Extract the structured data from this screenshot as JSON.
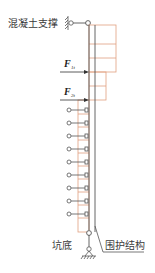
{
  "diagram": {
    "labels": {
      "concrete_strut": "混凝土支撑",
      "force_1": "F",
      "force_1_sub": "1t",
      "force_2": "F",
      "force_2_sub": "2t",
      "pit_bottom": "坑底",
      "retaining_structure": "围护结构"
    },
    "colors": {
      "load_grid": "#e0a080",
      "structure": "#555555",
      "background": "#ffffff"
    },
    "spring_count": 9
  }
}
